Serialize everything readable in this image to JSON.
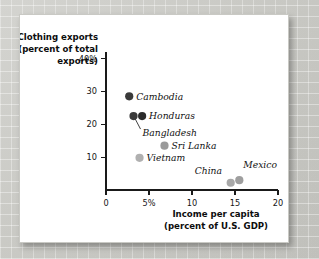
{
  "chart_data": {
    "type": "scatter",
    "title": "",
    "xlabel": "Income per capita (percent of U.S. GDP)",
    "ylabel": "Clothing exports (percent of total exports)",
    "xlabel_line1": "Income per capita",
    "xlabel_line2": "(percent of U.S. GDP)",
    "ylabel_line1": "Clothing exports",
    "ylabel_line2": "(percent of total",
    "ylabel_line3": "exports)",
    "xlim": [
      0,
      20
    ],
    "ylim": [
      0,
      42
    ],
    "grid": false,
    "legend": "none",
    "xticks": [
      0,
      5,
      10,
      15,
      20
    ],
    "xtick_labels": [
      "0",
      "5%",
      "10",
      "15",
      "20"
    ],
    "yticks": [
      10,
      20,
      30,
      40
    ],
    "ytick_labels": [
      "10",
      "20",
      "30",
      "40%"
    ],
    "points": [
      {
        "label": "Cambodia",
        "x": 2.7,
        "y": 28.5,
        "color": "#3a3a3a",
        "label_dx": 7,
        "label_dy": 3.2,
        "leader": false
      },
      {
        "label": "Bangladesh",
        "x": 3.2,
        "y": 22.5,
        "color": "#3a3a3a",
        "label_dx": 9,
        "label_dy": 20,
        "leader": true
      },
      {
        "label": "Honduras",
        "x": 4.2,
        "y": 22.5,
        "color": "#2b2b2b",
        "label_dx": 7,
        "label_dy": 3.2,
        "leader": false
      },
      {
        "label": "Sri Lanka",
        "x": 6.8,
        "y": 13.5,
        "color": "#9a9a9a",
        "label_dx": 7,
        "label_dy": 3.2,
        "leader": false
      },
      {
        "label": "Vietnam",
        "x": 3.9,
        "y": 9.8,
        "color": "#b0b0b0",
        "label_dx": 7,
        "label_dy": 3.2,
        "leader": false
      },
      {
        "label": "China",
        "x": 14.5,
        "y": 2.2,
        "color": "#a8a8a8",
        "label_dx": -36,
        "label_dy": -9,
        "leader": false
      },
      {
        "label": "Mexico",
        "x": 15.5,
        "y": 3.0,
        "color": "#9e9e9e",
        "label_dx": 4,
        "label_dy": -12,
        "leader": false
      }
    ],
    "colors": {
      "dark_marker": "#3a3a3a",
      "light_marker": "#a8a8a8",
      "axis": "#1a1a1a",
      "text": "#111111",
      "card_background": "#ffffff",
      "page_background": "#d8d8d4"
    }
  }
}
